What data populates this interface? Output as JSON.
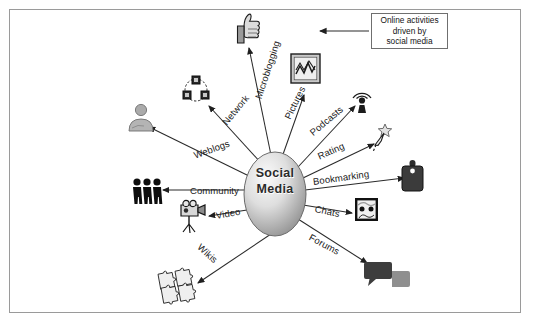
{
  "diagram": {
    "title": "Social Media",
    "center_label_line1": "Social",
    "center_label_line2": "Media",
    "callout": {
      "line1": "Online activities",
      "line2": "driven by",
      "line3": "social media"
    },
    "colors": {
      "frame_border": "#9a9a9a",
      "callout_border": "#6f6f6f",
      "line": "#2a2a2a",
      "oval_light": "#f2f2f2",
      "oval_dark": "#9d9d9d",
      "icon_dark": "#2b2b2b",
      "icon_mid": "#6e6e6e",
      "icon_light": "#b9b9b9",
      "background": "#ffffff"
    },
    "branches": [
      {
        "label": "Microblogging",
        "icon": "thumbs-up-icon",
        "rotation": -72,
        "label_x": 258,
        "label_y": 93
      },
      {
        "label": "Pictures",
        "icon": "framed-picture-icon",
        "rotation": -64,
        "label_x": 287,
        "label_y": 113
      },
      {
        "label": "Podcasts",
        "icon": "broadcast-tower-icon",
        "rotation": -40,
        "label_x": 311,
        "label_y": 128
      },
      {
        "label": "Rating",
        "icon": "star-cursor-icon",
        "rotation": -24,
        "label_x": 318,
        "label_y": 151
      },
      {
        "label": "Bookmarking",
        "icon": "tag-icon",
        "rotation": -8,
        "label_x": 313,
        "label_y": 176
      },
      {
        "label": "Chats",
        "icon": "chat-window-icon",
        "rotation": 12,
        "label_x": 315,
        "label_y": 203
      },
      {
        "label": "Forums",
        "icon": "speech-bubbles-icon",
        "rotation": 28,
        "label_x": 310,
        "label_y": 231
      },
      {
        "label": "Wikis",
        "icon": "puzzle-pieces-icon",
        "rotation": 42,
        "label_x": 199,
        "label_y": 240
      },
      {
        "label": "Video",
        "icon": "camcorder-icon",
        "rotation": -10,
        "label_x": 216,
        "label_y": 210
      },
      {
        "label": "Community",
        "icon": "three-people-icon",
        "rotation": 0,
        "label_x": 190,
        "label_y": 185
      },
      {
        "label": "Weblogs",
        "icon": "person-silhouette-icon",
        "rotation": -20,
        "label_x": 194,
        "label_y": 150
      },
      {
        "label": "Network",
        "icon": "network-nodes-icon",
        "rotation": -50,
        "label_x": 224,
        "label_y": 118
      }
    ]
  }
}
